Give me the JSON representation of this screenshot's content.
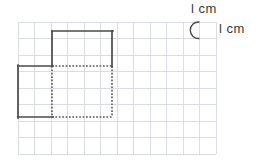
{
  "figure": {
    "background_color": "#ffffff"
  },
  "grid": {
    "columns": 12,
    "rows": 8,
    "cell_size_px": 16.5,
    "origin_x": 18,
    "origin_y": 22,
    "line_color": "#dadee3",
    "line_width": 1,
    "unit_label": "1 cm"
  },
  "legend": {
    "top_label": "l cm",
    "side_label": "l cm",
    "arc_color": "#4a4a4a",
    "text_color": "#3a3a3a",
    "arc_description": "measurement arc around one grid cell"
  },
  "shapes": {
    "stroke_color": "#4a4a4a",
    "dotted_color": "#5a5a5a",
    "stroke_width": 1.6,
    "upper_square": {
      "name": "upper-right-square",
      "x": 52,
      "y": 31,
      "width": 60,
      "height": 35,
      "edges": {
        "top": "solid",
        "right": "solid",
        "left": "solid",
        "bottom": "dotted"
      }
    },
    "lower_square": {
      "name": "lower-left-square",
      "x": 18,
      "y": 66,
      "width": 94,
      "height": 51,
      "edges": {
        "top": "solid-then-dotted",
        "left": "solid",
        "bottom": "solid-then-dotted",
        "right": "dotted"
      }
    }
  },
  "paths": {
    "solid_outline": "M 18 66 L 52 66 L 52 31 L 112 31 L 112 66 L 112 66 M 18 66 L 18 117 L 52 117",
    "solid_outline_segments": [
      "M 52 31 L 112 31",
      "M 112 31 L 112 66",
      "M 52 31 L 52 66",
      "M 18 66 L 52 66",
      "M 18 66 L 18 117",
      "M 18 117 L 52 117"
    ],
    "dotted_segments": [
      "M 52 66 L 112 66",
      "M 112 66 L 112 117",
      "M 52 117 L 112 117",
      "M 52 66 L 52 117"
    ]
  }
}
